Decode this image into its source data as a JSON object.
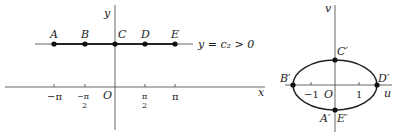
{
  "left_plot": {
    "x_axis_label": "x",
    "y_axis_label": "y",
    "origin_label": "O",
    "line_label": "y = c₂ > 0",
    "points": [
      {
        "label": "A",
        "x": "-π"
      },
      {
        "label": "B",
        "x": "-π/2"
      },
      {
        "label": "C",
        "x": "0"
      },
      {
        "label": "D",
        "x": "π/2"
      },
      {
        "label": "E",
        "x": "π"
      }
    ],
    "ticks": {
      "neg_pi": "−π",
      "neg_half_pi_num": "−π",
      "neg_half_pi_den": "2",
      "half_pi_num": "π",
      "half_pi_den": "2",
      "pi": "π"
    }
  },
  "right_plot": {
    "u_axis_label": "u",
    "v_axis_label": "v",
    "origin_label": "O",
    "curve": "ellipse",
    "points": [
      {
        "label": "C′"
      },
      {
        "label": "B′"
      },
      {
        "label": "D′"
      },
      {
        "label": "A′"
      },
      {
        "label": "E′"
      }
    ],
    "ticks": {
      "neg_one": "−1",
      "one": "1"
    }
  }
}
